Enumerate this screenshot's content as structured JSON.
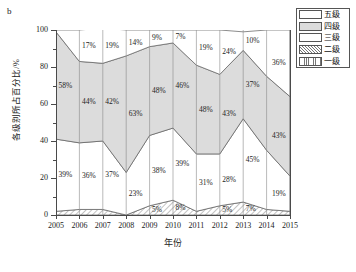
{
  "panel": {
    "letter": "b"
  },
  "legend": {
    "items": [
      {
        "label": "五级",
        "pattern": "solid-white",
        "color": "#ffffff"
      },
      {
        "label": "四级",
        "pattern": "solid-gray",
        "color": "#dcdcdc"
      },
      {
        "label": "三级",
        "pattern": "solid-white",
        "color": "#ffffff"
      },
      {
        "label": "二级",
        "pattern": "diagonal-hatch",
        "color": "#ffffff"
      },
      {
        "label": "一级",
        "pattern": "vertical-lines",
        "color": "#ffffff"
      }
    ]
  },
  "chart_data": {
    "type": "area",
    "title": "",
    "subtitle": "",
    "xlabel": "年份",
    "ylabel": "各级别所占百分比/%",
    "ylim": [
      0,
      100
    ],
    "yticks": [
      0,
      20,
      40,
      60,
      80,
      100
    ],
    "yticks_minor": [
      10,
      30,
      50,
      70,
      90
    ],
    "grid": false,
    "stacked": true,
    "stack_order_bottom_to_top": [
      "一级",
      "二级",
      "三级",
      "四级",
      "五级"
    ],
    "legend_position": "top-right",
    "categories": [
      "2005",
      "2006",
      "2007",
      "2008",
      "2009",
      "2010",
      "2011",
      "2012",
      "2013",
      "2014",
      "2015"
    ],
    "x": [
      2005,
      2006,
      2007,
      2008,
      2009,
      2010,
      2011,
      2012,
      2013,
      2014,
      2015
    ],
    "series": [
      {
        "name": "一级",
        "pattern": "vertical-lines",
        "values": [
          0,
          0,
          0,
          0,
          0,
          0,
          0,
          0,
          0,
          0,
          0
        ]
      },
      {
        "name": "二级",
        "pattern": "diagonal-hatch",
        "values": [
          2,
          3,
          3,
          0,
          5,
          8,
          2,
          5,
          7,
          3,
          2
        ]
      },
      {
        "name": "三级",
        "pattern": "solid-white",
        "values": [
          39,
          36,
          37,
          23,
          38,
          39,
          31,
          28,
          45,
          32,
          19
        ]
      },
      {
        "name": "四级",
        "pattern": "solid-gray",
        "values": [
          58,
          44,
          42,
          63,
          48,
          46,
          48,
          43,
          37,
          40,
          43
        ]
      },
      {
        "name": "五级",
        "pattern": "solid-white",
        "values": [
          1,
          17,
          19,
          14,
          9,
          7,
          19,
          24,
          10,
          25,
          36
        ]
      }
    ],
    "visible_data_labels": [
      {
        "series": "五级",
        "year": "2006",
        "text": "17%"
      },
      {
        "series": "五级",
        "year": "2007",
        "text": "19%"
      },
      {
        "series": "五级",
        "year": "2008",
        "text": "14%"
      },
      {
        "series": "五级",
        "year": "2009",
        "text": "9%"
      },
      {
        "series": "五级",
        "year": "2010",
        "text": "7%"
      },
      {
        "series": "五级",
        "year": "2011",
        "text": "19%"
      },
      {
        "series": "五级",
        "year": "2012",
        "text": "24%"
      },
      {
        "series": "五级",
        "year": "2013",
        "text": "10%"
      },
      {
        "series": "五级",
        "year": "2015",
        "text": "36%"
      },
      {
        "series": "四级",
        "year": "2005",
        "text": "58%"
      },
      {
        "series": "四级",
        "year": "2006",
        "text": "44%"
      },
      {
        "series": "四级",
        "year": "2007",
        "text": "42%"
      },
      {
        "series": "四级",
        "year": "2008",
        "text": "63%"
      },
      {
        "series": "四级",
        "year": "2009",
        "text": "48%"
      },
      {
        "series": "四级",
        "year": "2010",
        "text": "46%"
      },
      {
        "series": "四级",
        "year": "2011",
        "text": "48%"
      },
      {
        "series": "四级",
        "year": "2012",
        "text": "43%"
      },
      {
        "series": "四级",
        "year": "2013",
        "text": "37%"
      },
      {
        "series": "四级",
        "year": "2015",
        "text": "43%"
      },
      {
        "series": "三级",
        "year": "2005",
        "text": "39%"
      },
      {
        "series": "三级",
        "year": "2006",
        "text": "36%"
      },
      {
        "series": "三级",
        "year": "2007",
        "text": "37%"
      },
      {
        "series": "三级",
        "year": "2008",
        "text": "23%"
      },
      {
        "series": "三级",
        "year": "2009",
        "text": "38%"
      },
      {
        "series": "三级",
        "year": "2010",
        "text": "39%"
      },
      {
        "series": "三级",
        "year": "2011",
        "text": "31%"
      },
      {
        "series": "三级",
        "year": "2012",
        "text": "28%"
      },
      {
        "series": "三级",
        "year": "2013",
        "text": "45%"
      },
      {
        "series": "三级",
        "year": "2015",
        "text": "19%"
      },
      {
        "series": "二级",
        "year": "2009",
        "text": "5%"
      },
      {
        "series": "二级",
        "year": "2010",
        "text": "8%"
      },
      {
        "series": "二级",
        "year": "2012",
        "text": "5%"
      },
      {
        "series": "二级",
        "year": "2013",
        "text": "7%"
      }
    ]
  },
  "axis": {
    "ytick_labels": [
      "100",
      "80",
      "60",
      "40",
      "20",
      "0"
    ],
    "xtick_labels": [
      "2005",
      "2006",
      "2007",
      "2008",
      "2009",
      "2010",
      "2011",
      "2012",
      "2013",
      "2014",
      "2015"
    ]
  },
  "colors": {
    "gray_fill": "#dcdcdc",
    "white_fill": "#ffffff",
    "line": "#555555",
    "axis": "#4a4a4a",
    "text": "#1a1a1a"
  }
}
